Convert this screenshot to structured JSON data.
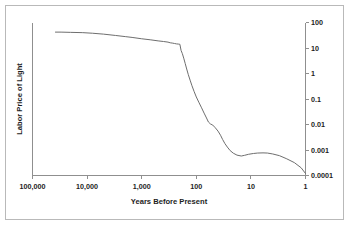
{
  "chart_data": {
    "type": "line",
    "title": "",
    "xlabel": "Years Before Present",
    "ylabel": "Labor Price of Light",
    "xscale": "log",
    "yscale": "log",
    "x_axis_reversed": true,
    "xlim": [
      100000,
      1
    ],
    "ylim": [
      0.0001,
      100
    ],
    "grid": false,
    "legend": null,
    "x_tick_labels": [
      "100,000",
      "10,000",
      "1,000",
      "100",
      "10",
      "1"
    ],
    "x_ticks": [
      100000,
      10000,
      1000,
      100,
      10,
      1
    ],
    "y_tick_labels": [
      "100",
      "10",
      "1",
      "0.1",
      "0.01",
      "0.001",
      "0.0001"
    ],
    "y_ticks": [
      100,
      10,
      1,
      0.1,
      0.01,
      0.001,
      0.0001
    ],
    "y_axis_position": "right",
    "series": [
      {
        "name": "Labor Price of Light",
        "x": [
          38000,
          30000,
          20000,
          12000,
          8000,
          5000,
          3000,
          2000,
          1500,
          1000,
          700,
          500,
          400,
          330,
          300,
          270,
          250,
          230,
          210,
          200,
          190,
          180,
          170,
          160,
          150,
          140,
          130,
          120,
          110,
          100,
          90,
          80,
          72,
          65,
          60,
          55,
          50,
          45,
          40,
          36,
          33,
          30,
          27,
          24,
          21,
          18,
          15,
          13,
          11,
          9,
          7.5,
          6,
          5,
          4,
          3,
          2.2,
          1.6,
          1.2,
          1
        ],
        "y": [
          42,
          42,
          41,
          40,
          38,
          35,
          31,
          28,
          26,
          23,
          21,
          19,
          18,
          17,
          16,
          15.5,
          15,
          14.5,
          14.2,
          14,
          8,
          6,
          4,
          2.5,
          1.5,
          0.9,
          0.55,
          0.33,
          0.2,
          0.12,
          0.075,
          0.045,
          0.028,
          0.018,
          0.0125,
          0.0105,
          0.0095,
          0.0075,
          0.0055,
          0.0038,
          0.0026,
          0.0018,
          0.0013,
          0.00095,
          0.00075,
          0.00063,
          0.00058,
          0.00062,
          0.00068,
          0.00073,
          0.00076,
          0.00077,
          0.00076,
          0.0007,
          0.0006,
          0.00045,
          0.00032,
          0.0002,
          0.00012
        ]
      }
    ]
  },
  "figure": {
    "y_axis_title": "Labor Price of Light",
    "x_axis_title": "Years Before Present"
  }
}
